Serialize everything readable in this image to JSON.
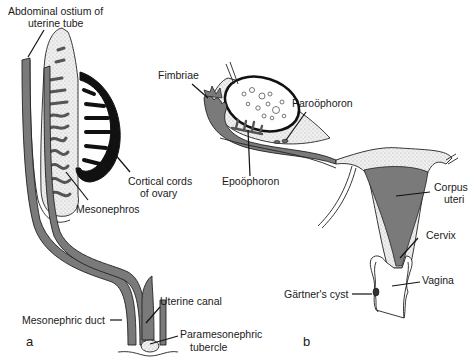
{
  "figure": {
    "panels": [
      {
        "id": "a",
        "label": "a",
        "labels": {
          "abdominal_ostium_line1": "Abdominal ostium of",
          "abdominal_ostium_line2": "uterine tube",
          "cortical_cords_line1": "Cortical cords",
          "cortical_cords_line2": "of ovary",
          "mesonephros": "Mesonephros",
          "mesonephric_duct": "Mesonephric duct",
          "uterine_canal": "Uterine canal",
          "paramesonephric_tubercle_line1": "Paramesonephric",
          "paramesonephric_tubercle_line2": "tubercle"
        }
      },
      {
        "id": "b",
        "label": "b",
        "labels": {
          "fimbriae": "Fimbriae",
          "paroophoron": "Paroöphoron",
          "epoophoron": "Epoöphoron",
          "corpus_uteri_line1": "Corpus",
          "corpus_uteri_line2": "uteri",
          "cervix": "Cervix",
          "vagina": "Vagina",
          "gartners_cyst": "Gärtner's cyst"
        }
      }
    ],
    "colors": {
      "duct_fill": "#7a7a7a",
      "cortex_fill": "#111111",
      "stipple_bg": "#ececec",
      "line": "#111111"
    }
  }
}
